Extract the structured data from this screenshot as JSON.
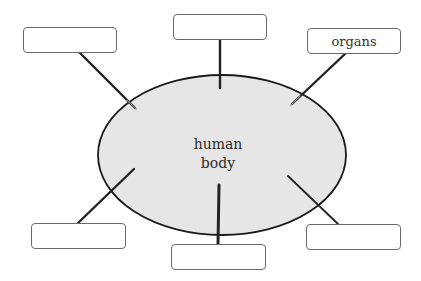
{
  "diagram": {
    "type": "concept-map",
    "center": {
      "line1": "human",
      "line2": "body",
      "fill": "#e6e6e6",
      "stroke": "#1a1a1a"
    },
    "boxes": [
      {
        "id": "top-left",
        "text": ""
      },
      {
        "id": "top-center",
        "text": ""
      },
      {
        "id": "top-right",
        "text": "organs"
      },
      {
        "id": "bottom-left",
        "text": ""
      },
      {
        "id": "bottom-center",
        "text": ""
      },
      {
        "id": "bottom-right",
        "text": ""
      }
    ],
    "connector_color": "#222222"
  }
}
